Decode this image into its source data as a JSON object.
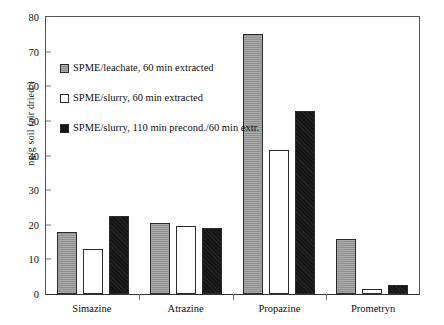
{
  "chart_data": {
    "type": "bar",
    "title": "",
    "xlabel": "",
    "ylabel": "ng/g soil (air dried )",
    "ylim": [
      0,
      80
    ],
    "yticks": [
      0,
      10,
      20,
      30,
      40,
      50,
      60,
      70,
      80
    ],
    "grid": false,
    "legend_position": "inside-upper-left",
    "categories": [
      "Simazine",
      "Atrazine",
      "Propazine",
      "Prometryn"
    ],
    "series": [
      {
        "name": "SPME/leachate, 60 min extracted",
        "swatch": "gray-hatched",
        "color": "#9a9a9a",
        "values": [
          18,
          20.5,
          75,
          16
        ]
      },
      {
        "name": "SPME/slurry, 60 min extracted",
        "swatch": "white",
        "color": "#ffffff",
        "values": [
          13,
          19.5,
          41.5,
          1.5
        ]
      },
      {
        "name": "SPME/slurry, 110 min precond./60 min extr.",
        "swatch": "black",
        "color": "#161616",
        "values": [
          22.5,
          19,
          53,
          2.5
        ]
      }
    ]
  },
  "axes": {
    "y_title": "ng/g soil (air dried )",
    "y_tick_labels": [
      "0",
      "10",
      "20",
      "30",
      "40",
      "50",
      "60",
      "70",
      "80"
    ],
    "x_tick_labels": [
      "Simazine",
      "Atrazine",
      "Propazine",
      "Prometryn"
    ]
  },
  "legend": {
    "entries": [
      {
        "label": "SPME/leachate, 60 min extracted"
      },
      {
        "label": "SPME/slurry, 60 min extracted"
      },
      {
        "label": "SPME/slurry, 110 min precond./60 min extr."
      }
    ]
  }
}
